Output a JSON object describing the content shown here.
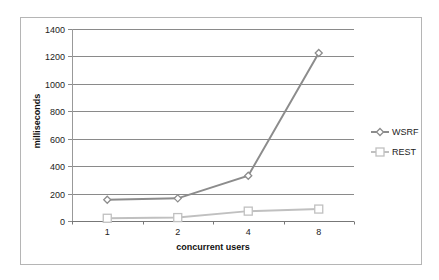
{
  "chart_data": {
    "type": "line",
    "title": "",
    "xlabel": "concurrent users",
    "ylabel": "milliseconds",
    "categories": [
      "1",
      "2",
      "4",
      "8"
    ],
    "series": [
      {
        "name": "WSRF",
        "values": [
          155,
          165,
          330,
          1225
        ],
        "color": "#8c8c8c",
        "marker": "diamond"
      },
      {
        "name": "REST",
        "values": [
          20,
          25,
          72,
          87
        ],
        "color": "#c0c0c0",
        "marker": "square"
      }
    ],
    "ylim": [
      0,
      1400
    ],
    "yticks": [
      0,
      200,
      400,
      600,
      800,
      1000,
      1200,
      1400
    ],
    "grid": true,
    "legend_position": "right"
  },
  "colors": {
    "wsrf": "#8c8c8c",
    "rest": "#c0c0c0",
    "grid": "#8a8a8a",
    "frame": "#b5b5b5"
  }
}
